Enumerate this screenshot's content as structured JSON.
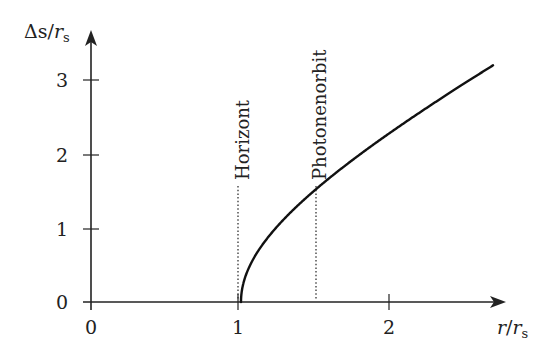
{
  "chart_data": {
    "type": "line",
    "title": "",
    "xlabel": "r/r_s",
    "ylabel": "Δs/r_s",
    "xlim": [
      0,
      2.7
    ],
    "ylim": [
      0,
      3.3
    ],
    "x_ticks": [
      "0",
      "1",
      "2"
    ],
    "y_ticks": [
      "0",
      "1",
      "2",
      "3"
    ],
    "grid": false,
    "legend": null,
    "series": [
      {
        "name": "Δs/r_s (proper radial distance from horizon)",
        "formula": "sqrt(r(r-1)) + ln(sqrt(r) + sqrt(r-1)) for r>=1, 0 for r<1",
        "x": [
          0,
          0.5,
          1.0,
          1.01,
          1.05,
          1.1,
          1.2,
          1.3,
          1.5,
          1.75,
          2.0,
          2.25,
          2.5,
          2.68
        ],
        "y": [
          0,
          0,
          0,
          0.2,
          0.45,
          0.64,
          0.93,
          1.19,
          1.52,
          1.97,
          2.3,
          2.69,
          3.03,
          3.24
        ]
      }
    ],
    "annotations": [
      {
        "text": "Horizont",
        "x": 1.0,
        "style": "dotted vertical line",
        "y_top": 1.57
      },
      {
        "text": "Photonenorbit",
        "x": 1.5,
        "style": "dotted vertical line",
        "y_top": 1.57
      }
    ]
  },
  "axes": {
    "x_label_main": "r",
    "x_label_sep": "/",
    "x_label_den": "r",
    "x_label_sub": "s",
    "y_label_main": "Δs",
    "y_label_sep": "/",
    "y_label_den": "r",
    "y_label_sub": "s"
  },
  "ticks": {
    "x": [
      "0",
      "1",
      "2"
    ],
    "y": [
      "0",
      "1",
      "2",
      "3"
    ]
  },
  "annotations": {
    "horizon": "Horizont",
    "photon_orbit": "Photonenorbit"
  }
}
